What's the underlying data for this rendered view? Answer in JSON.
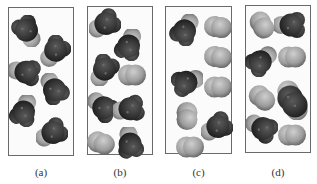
{
  "figure": {
    "panels": [
      {
        "id": "a",
        "label": "(a)",
        "frame": {
          "x": 8,
          "y": 7,
          "w": 66,
          "h": 149
        },
        "molecules": [
          {
            "type": "dark",
            "x": 27,
            "y": 31,
            "rot": -30
          },
          {
            "type": "dark",
            "x": 55,
            "y": 51,
            "rot": 40
          },
          {
            "type": "dark",
            "x": 25,
            "y": 72,
            "rot": 100
          },
          {
            "type": "dark",
            "x": 54,
            "y": 89,
            "rot": 150
          },
          {
            "type": "dark",
            "x": 24,
            "y": 111,
            "rot": 200
          },
          {
            "type": "dark",
            "x": 52,
            "y": 133,
            "rot": 60
          }
        ]
      },
      {
        "id": "b",
        "label": "(b)",
        "frame": {
          "x": 87,
          "y": 6,
          "w": 66,
          "h": 149
        },
        "molecules": [
          {
            "type": "dark",
            "x": 105,
            "y": 24,
            "rot": 60
          },
          {
            "type": "dark",
            "x": 129,
            "y": 45,
            "rot": 200
          },
          {
            "type": "dark",
            "x": 104,
            "y": 70,
            "rot": 30
          },
          {
            "type": "light",
            "x": 132,
            "y": 75,
            "rot": 0
          },
          {
            "type": "dark",
            "x": 103,
            "y": 107,
            "rot": 130
          },
          {
            "type": "dark",
            "x": 129,
            "y": 109,
            "rot": 80
          },
          {
            "type": "light",
            "x": 101,
            "y": 143,
            "rot": 20
          },
          {
            "type": "dark",
            "x": 130,
            "y": 143,
            "rot": 170
          }
        ]
      },
      {
        "id": "c",
        "label": "(c)",
        "frame": {
          "x": 165,
          "y": 6,
          "w": 67,
          "h": 148
        },
        "molecules": [
          {
            "type": "dark",
            "x": 185,
            "y": 30,
            "rot": 210
          },
          {
            "type": "light",
            "x": 218,
            "y": 27,
            "rot": 10
          },
          {
            "type": "light",
            "x": 218,
            "y": 57,
            "rot": 10
          },
          {
            "type": "dark",
            "x": 187,
            "y": 82,
            "rot": 250
          },
          {
            "type": "light",
            "x": 218,
            "y": 87,
            "rot": 0
          },
          {
            "type": "light",
            "x": 187,
            "y": 116,
            "rot": 90
          },
          {
            "type": "dark",
            "x": 217,
            "y": 127,
            "rot": 60
          },
          {
            "type": "light",
            "x": 190,
            "y": 147,
            "rot": 0
          }
        ]
      },
      {
        "id": "d",
        "label": "(d)",
        "frame": {
          "x": 245,
          "y": 5,
          "w": 66,
          "h": 148
        },
        "molecules": [
          {
            "type": "light",
            "x": 262,
            "y": 25,
            "rot": 60
          },
          {
            "type": "dark",
            "x": 290,
            "y": 25,
            "rot": 90
          },
          {
            "type": "dark",
            "x": 261,
            "y": 61,
            "rot": 230
          },
          {
            "type": "light",
            "x": 292,
            "y": 57,
            "rot": 0
          },
          {
            "type": "light",
            "x": 262,
            "y": 98,
            "rot": 40
          },
          {
            "type": "dimer",
            "x": 292,
            "y": 100,
            "rot": 0
          },
          {
            "type": "dark",
            "x": 262,
            "y": 128,
            "rot": 120
          },
          {
            "type": "light",
            "x": 292,
            "y": 135,
            "rot": 0
          }
        ]
      }
    ],
    "label_y": 166,
    "colors": {
      "frame_border": "#6a6a6a",
      "dark_core": "#3a3a3a",
      "dark_edge": "#1f1f1f",
      "light_cap": "#b8b8b8",
      "light_body": "#a3a3a3",
      "label_text": "#333333"
    }
  }
}
